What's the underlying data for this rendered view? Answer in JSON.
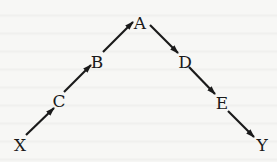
{
  "diagram": {
    "type": "directed-path",
    "colors": {
      "background": "#f7f7f5",
      "stroke": "#1a1a1a",
      "text": "#1a1a1a"
    },
    "nodes": [
      {
        "id": "X",
        "label": "X",
        "x": 20,
        "y": 146
      },
      {
        "id": "C",
        "label": "C",
        "x": 59,
        "y": 102
      },
      {
        "id": "B",
        "label": "B",
        "x": 97,
        "y": 63
      },
      {
        "id": "A",
        "label": "A",
        "x": 140,
        "y": 24
      },
      {
        "id": "D",
        "label": "D",
        "x": 185,
        "y": 63
      },
      {
        "id": "E",
        "label": "E",
        "x": 222,
        "y": 104
      },
      {
        "id": "Y",
        "label": "Y",
        "x": 262,
        "y": 146
      }
    ],
    "edges": [
      {
        "from": "X",
        "to": "C",
        "x1": 26,
        "y1": 135,
        "x2": 54,
        "y2": 108
      },
      {
        "from": "C",
        "to": "B",
        "x1": 64,
        "y1": 92,
        "x2": 91,
        "y2": 65
      },
      {
        "from": "B",
        "to": "A",
        "x1": 103,
        "y1": 52,
        "x2": 133,
        "y2": 22
      },
      {
        "from": "A",
        "to": "D",
        "x1": 150,
        "y1": 25,
        "x2": 178,
        "y2": 53
      },
      {
        "from": "D",
        "to": "E",
        "x1": 189,
        "y1": 67,
        "x2": 215,
        "y2": 94
      },
      {
        "from": "E",
        "to": "Y",
        "x1": 228,
        "y1": 111,
        "x2": 254,
        "y2": 137
      }
    ]
  }
}
